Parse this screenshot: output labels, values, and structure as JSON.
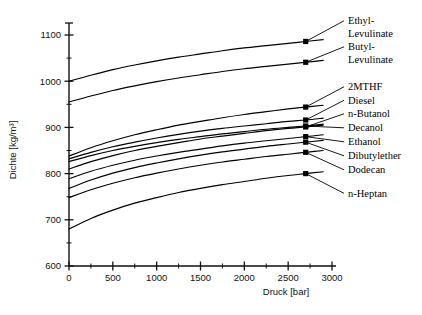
{
  "chart_data": {
    "type": "line",
    "title": "",
    "xlabel": "Druck [bar]",
    "ylabel": "Dichte [kg/m³]",
    "xlim": [
      0,
      3000
    ],
    "ylim": [
      600,
      1150
    ],
    "grid": false,
    "legend_position": "right-labels-with-leader-lines",
    "x_ticks": [
      "0",
      "500",
      "1000",
      "1500",
      "2000",
      "2500",
      "3000"
    ],
    "x_tick_values": [
      0,
      500,
      1000,
      1500,
      2000,
      2500,
      3000
    ],
    "x_minor_tick_values": [
      250,
      750,
      1250,
      1750,
      2250,
      2750
    ],
    "y_ticks": [
      "600",
      "700",
      "800",
      "900",
      "1000",
      "1100"
    ],
    "y_tick_values": [
      600,
      700,
      800,
      900,
      1000,
      1100
    ],
    "y_minor_tick_values": [
      650,
      750,
      850,
      950,
      1050,
      1150
    ],
    "marker_pressure": 2700,
    "series": [
      {
        "name": "Ethyl-Levulinate",
        "label": "Ethyl-\nLevulinate",
        "label_lines": [
          "Ethyl-",
          "Levulinate"
        ],
        "x": [
          0,
          250,
          500,
          750,
          1000,
          1250,
          1500,
          1750,
          2000,
          2250,
          2500,
          2700,
          2900
        ],
        "y": [
          1000,
          1013,
          1025,
          1035,
          1044,
          1052,
          1059,
          1066,
          1072,
          1077,
          1082,
          1086,
          1090
        ],
        "marker_at": [
          2700,
          1086
        ]
      },
      {
        "name": "Butyl-Levulinate",
        "label": "Butyl-\nLevulinate",
        "label_lines": [
          "Butyl-",
          "Levulinate"
        ],
        "x": [
          0,
          250,
          500,
          750,
          1000,
          1250,
          1500,
          1750,
          2000,
          2250,
          2500,
          2700,
          2900
        ],
        "y": [
          955,
          968,
          980,
          990,
          999,
          1007,
          1014,
          1021,
          1027,
          1032,
          1037,
          1041,
          1045
        ],
        "marker_at": [
          2700,
          1041
        ]
      },
      {
        "name": "2MTHF",
        "label": "2MTHF",
        "label_lines": [
          "2MTHF"
        ],
        "x": [
          0,
          250,
          500,
          750,
          1000,
          1250,
          1500,
          1750,
          2000,
          2250,
          2500,
          2700,
          2900
        ],
        "y": [
          838,
          856,
          871,
          884,
          895,
          905,
          913,
          921,
          928,
          934,
          940,
          944,
          948
        ],
        "marker_at": [
          2700,
          944
        ]
      },
      {
        "name": "Diesel",
        "label": "Diesel",
        "label_lines": [
          "Diesel"
        ],
        "x": [
          0,
          250,
          500,
          750,
          1000,
          1250,
          1500,
          1750,
          2000,
          2250,
          2500,
          2700,
          2900
        ],
        "y": [
          832,
          846,
          858,
          868,
          877,
          885,
          892,
          898,
          903,
          908,
          913,
          916,
          920
        ],
        "marker_at": [
          2700,
          916
        ]
      },
      {
        "name": "n-Butanol",
        "label": "n-Butanol",
        "label_lines": [
          "n-Butanol"
        ],
        "x": [
          0,
          250,
          500,
          750,
          1000,
          1250,
          1500,
          1750,
          2000,
          2250,
          2500,
          2700,
          2900
        ],
        "y": [
          810,
          826,
          839,
          850,
          859,
          867,
          875,
          881,
          887,
          893,
          898,
          901,
          905
        ],
        "marker_at": [
          2700,
          901
        ]
      },
      {
        "name": "Decanol",
        "label": "Decanol",
        "label_lines": [
          "Decanol"
        ],
        "x": [
          0,
          250,
          500,
          750,
          1000,
          1250,
          1500,
          1750,
          2000,
          2250,
          2500,
          2700,
          2900
        ],
        "y": [
          826,
          839,
          850,
          859,
          867,
          874,
          880,
          886,
          891,
          896,
          900,
          903,
          907
        ],
        "marker_at": [
          2700,
          903
        ]
      },
      {
        "name": "Ethanol",
        "label": "Ethanol",
        "label_lines": [
          "Ethanol"
        ],
        "x": [
          0,
          250,
          500,
          750,
          1000,
          1250,
          1500,
          1750,
          2000,
          2250,
          2500,
          2700,
          2900
        ],
        "y": [
          789,
          805,
          818,
          829,
          838,
          846,
          853,
          860,
          866,
          871,
          876,
          880,
          884
        ],
        "marker_at": [
          2700,
          880
        ]
      },
      {
        "name": "Dibutylether",
        "label": "Dibutylether",
        "label_lines": [
          "Dibutylether"
        ],
        "x": [
          0,
          250,
          500,
          750,
          1000,
          1250,
          1500,
          1750,
          2000,
          2250,
          2500,
          2700,
          2900
        ],
        "y": [
          768,
          786,
          801,
          813,
          823,
          832,
          840,
          847,
          853,
          859,
          864,
          868,
          872
        ],
        "marker_at": [
          2700,
          868
        ]
      },
      {
        "name": "Dodecan",
        "label": "Dodecan",
        "label_lines": [
          "Dodecan"
        ],
        "x": [
          0,
          250,
          500,
          750,
          1000,
          1250,
          1500,
          1750,
          2000,
          2250,
          2500,
          2700,
          2900
        ],
        "y": [
          748,
          765,
          779,
          791,
          801,
          810,
          818,
          825,
          831,
          837,
          842,
          846,
          850
        ],
        "marker_at": [
          2700,
          846
        ]
      },
      {
        "name": "n-Heptan",
        "label": "n-Heptan",
        "label_lines": [
          "n-Heptan"
        ],
        "x": [
          0,
          250,
          500,
          750,
          1000,
          1250,
          1500,
          1750,
          2000,
          2250,
          2500,
          2700,
          2900
        ],
        "y": [
          680,
          703,
          721,
          736,
          748,
          759,
          768,
          776,
          783,
          790,
          796,
          800,
          804
        ],
        "marker_at": [
          2700,
          800
        ]
      }
    ],
    "labels_right": [
      {
        "id": "ethyl-levulinate",
        "lines": [
          "Ethyl-",
          "Levulinate"
        ]
      },
      {
        "id": "butyl-levulinate",
        "lines": [
          "Butyl-",
          "Levulinate"
        ]
      },
      {
        "id": "2mthf",
        "lines": [
          "2MTHF"
        ]
      },
      {
        "id": "diesel",
        "lines": [
          "Diesel"
        ]
      },
      {
        "id": "n-butanol",
        "lines": [
          "n-Butanol"
        ]
      },
      {
        "id": "decanol",
        "lines": [
          "Decanol"
        ]
      },
      {
        "id": "ethanol",
        "lines": [
          "Ethanol"
        ]
      },
      {
        "id": "dibutylether",
        "lines": [
          "Dibutylether"
        ]
      },
      {
        "id": "dodecan",
        "lines": [
          "Dodecan"
        ]
      },
      {
        "id": "n-heptan",
        "lines": [
          "n-Heptan"
        ]
      }
    ]
  },
  "colors": {
    "background": "#ffffff",
    "ink": "#000000",
    "axis": "#111111"
  }
}
